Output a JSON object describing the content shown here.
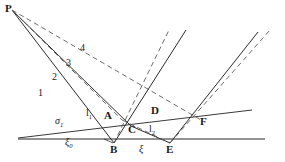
{
  "figure": {
    "type": "ray-diagram",
    "background": "#ffffff",
    "stroke_solid": "#2b2b2b",
    "stroke_dashed": "#5a5a5a",
    "stroke_baseline": "#6e6e6e",
    "width": 285,
    "height": 162
  },
  "points": {
    "P": {
      "label": "P",
      "x": 12,
      "y": 10
    },
    "A": {
      "label": "A",
      "x": 111,
      "y": 118
    },
    "B": {
      "label": "B",
      "x": 114,
      "y": 143
    },
    "C": {
      "label": "C",
      "x": 131,
      "y": 126
    },
    "D": {
      "label": "D",
      "x": 156,
      "y": 114
    },
    "E": {
      "label": "E",
      "x": 170,
      "y": 143
    },
    "F": {
      "label": "F",
      "x": 201,
      "y": 120
    }
  },
  "ray_labels": [
    {
      "label": "1",
      "x": 70,
      "y": 93
    },
    {
      "label": "2",
      "x": 84,
      "y": 79
    },
    {
      "label": "3",
      "x": 96,
      "y": 68
    },
    {
      "label": "4",
      "x": 104,
      "y": 54
    }
  ],
  "segment_labels": [
    {
      "label": "l",
      "sub": "1",
      "x": 88,
      "y": 115
    },
    {
      "label": "l",
      "sub": "2",
      "x": 152,
      "y": 128
    }
  ],
  "greek_labels": [
    {
      "label": "σ",
      "sub": "1",
      "x": 58,
      "y": 120
    },
    {
      "label": "ξ",
      "sub": "0",
      "x": 68,
      "y": 142
    },
    {
      "label": "ξ",
      "sub": "",
      "x": 140,
      "y": 145
    }
  ]
}
